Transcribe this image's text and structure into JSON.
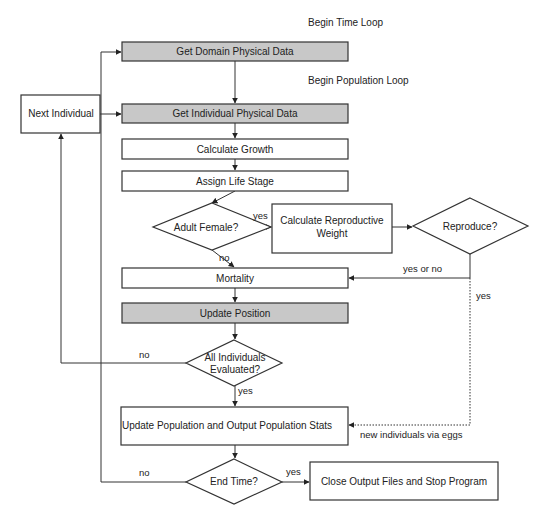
{
  "annotations": {
    "time_loop": "Begin Time Loop",
    "population_loop": "Begin Population Loop"
  },
  "colors": {
    "highlight_fill": "#c8c8c8",
    "box_fill": "#ffffff",
    "stroke": "#333333"
  },
  "nodes": {
    "get_domain": "Get Domain Physical Data",
    "get_individual": "Get Individual Physical Data",
    "next_individual": "Next Individual",
    "calc_growth": "Calculate Growth",
    "assign_stage": "Assign Life Stage",
    "adult_female": "Adult Female?",
    "calc_repro_line1": "Calculate Reproductive",
    "calc_repro_line2": "Weight",
    "reproduce": "Reproduce?",
    "mortality": "Mortality",
    "update_position": "Update Position",
    "all_eval_line1": "All Individuals",
    "all_eval_line2": "Evaluated?",
    "update_population": "Update Population and Output Population Stats",
    "end_time": "End Time?",
    "close_output": "Close Output Files and Stop Program"
  },
  "edge_labels": {
    "adult_yes": "yes",
    "adult_no": "no",
    "repro_yes_or_no": "yes or no",
    "repro_yes": "yes",
    "new_individuals": "new individuals via eggs",
    "all_eval_no": "no",
    "all_eval_yes": "yes",
    "end_no": "no",
    "end_yes": "yes"
  }
}
